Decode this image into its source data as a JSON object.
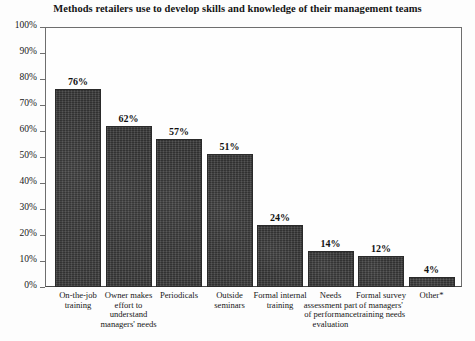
{
  "chart_data": {
    "type": "bar",
    "title": "Methods retailers use to develop skills and knowledge of their management teams",
    "xlabel": "",
    "ylabel": "",
    "ylim": [
      0,
      100
    ],
    "grid": false,
    "legend": "none",
    "orientation": "vertical",
    "value_label_format": "{v}%",
    "categories": [
      "On-the-job training",
      "Owner makes effort to understand managers' needs",
      "Periodicals",
      "Outside seminars",
      "Formal internal training",
      "Needs assessment part of performance evaluation",
      "Formal survey of managers' training needs",
      "Other*"
    ],
    "values": [
      76,
      62,
      57,
      51,
      24,
      14,
      12,
      4
    ],
    "value_labels": [
      "76%",
      "62%",
      "57%",
      "51%",
      "24%",
      "14%",
      "12%",
      "4%"
    ],
    "y_ticks": [
      0,
      10,
      20,
      30,
      40,
      50,
      60,
      70,
      80,
      90,
      100
    ],
    "y_tick_labels": [
      "0%",
      "10%",
      "20%",
      "30%",
      "40%",
      "50%",
      "60%",
      "70%",
      "80%",
      "90%",
      "100%"
    ],
    "bar_color": "#3b3b3b",
    "background_color": "#fdfdfd",
    "axis_color": "#6e6e6e"
  }
}
